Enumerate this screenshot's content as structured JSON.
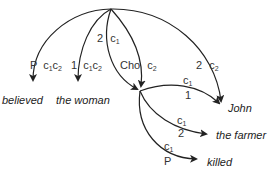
{
  "diagram": {
    "type": "dependency-graph",
    "nodes": {
      "root": {
        "x": 111,
        "y": 9
      },
      "mid": {
        "x": 140,
        "y": 91
      }
    },
    "words": [
      {
        "id": "believed",
        "text": "believed",
        "x": 2,
        "y": 95
      },
      {
        "id": "the-woman",
        "text": "the woman",
        "x": 56,
        "y": 95
      },
      {
        "id": "john",
        "text": "John",
        "x": 228,
        "y": 103
      },
      {
        "id": "the-farmer",
        "text": "the farmer",
        "x": 216,
        "y": 130
      },
      {
        "id": "killed",
        "text": "killed",
        "x": 207,
        "y": 157
      }
    ],
    "edges": [
      {
        "from": "root",
        "to": "believed",
        "rel": "P",
        "tags": "c1 c2"
      },
      {
        "from": "root",
        "to": "the woman",
        "rel": "1",
        "tags": "c1 c2"
      },
      {
        "from": "root",
        "to": "mid",
        "rel": "2",
        "tags": "c1"
      },
      {
        "from": "root",
        "to": "mid",
        "rel": "Cho",
        "tags": "c2"
      },
      {
        "from": "root",
        "to": "John",
        "rel": "2",
        "tags": "c2"
      },
      {
        "from": "mid",
        "to": "John",
        "rel": "1",
        "tags": "c1"
      },
      {
        "from": "mid",
        "to": "the farmer",
        "rel": "2",
        "tags": "c1"
      },
      {
        "from": "mid",
        "to": "killed",
        "rel": "P",
        "tags": "c1"
      }
    ],
    "labels": {
      "believed_rel": "P",
      "believed_c": "c",
      "believed_s1": "1",
      "believed_c2": "c",
      "believed_s2": "2",
      "woman_rel": "1",
      "woman_c": "c",
      "woman_s1": "1",
      "woman_c2": "c",
      "woman_s2": "2",
      "mid_a_rel": "2",
      "mid_a_c": "c",
      "mid_a_s": "1",
      "mid_b_rel": "Cho",
      "mid_b_c": "c",
      "mid_b_s": "2",
      "john_root_rel": "2",
      "john_root_c": "c",
      "john_root_s": "2",
      "john_mid_c": "c",
      "john_mid_s": "1",
      "john_mid_rel": "1",
      "farmer_c": "c",
      "farmer_s": "1",
      "farmer_rel": "2",
      "killed_c": "c",
      "killed_s": "1",
      "killed_rel": "P"
    }
  }
}
